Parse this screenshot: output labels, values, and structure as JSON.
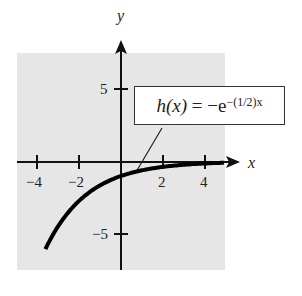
{
  "chart_data": {
    "type": "line",
    "title": "",
    "xlabel": "x",
    "ylabel": "y",
    "xlim": [
      -5,
      5
    ],
    "ylim": [
      -7.5,
      7.5
    ],
    "xticks": [
      -4,
      -2,
      2,
      4
    ],
    "yticks": [
      5,
      -5
    ],
    "xtick_labels": [
      "−4",
      "−2",
      "2",
      "4"
    ],
    "ytick_labels": [
      "5",
      "−5"
    ],
    "grid": false,
    "background": "#e6e6e6",
    "annotation": {
      "function": "h(x)",
      "equals": "=",
      "expression": "−e",
      "exponent": "−(1/2)x"
    },
    "series": [
      {
        "name": "h(x) = -e^(-(1/2)x)",
        "x": [
          -4,
          -3,
          -2,
          -1,
          0,
          1,
          2,
          3,
          4,
          5
        ],
        "values": [
          -7.39,
          -4.48,
          -2.72,
          -1.65,
          -1.0,
          -0.61,
          -0.37,
          -0.22,
          -0.14,
          -0.08
        ]
      }
    ]
  },
  "axes": {
    "x_label": "x",
    "y_label": "y"
  },
  "ticks": {
    "x_neg4": "−4",
    "x_neg2": "−2",
    "x_2": "2",
    "x_4": "4",
    "y_5": "5",
    "y_neg5": "−5"
  },
  "annotation": {
    "lhs": "h(x)",
    "eq": " = −e",
    "exp": "−(1/2)x"
  }
}
